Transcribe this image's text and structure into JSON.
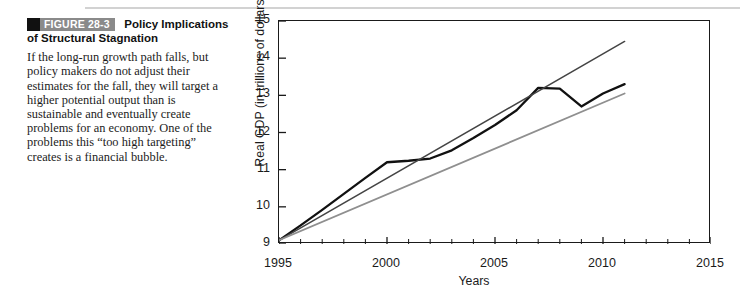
{
  "figure": {
    "badge_label": "FIGURE 28-3",
    "title_line1": "Policy Implications",
    "title_line2": "of Structural Stagnation",
    "body": "If the long-run growth path falls, but policy makers do not adjust their estimates for the fall, they will target a higher potential output than is sustainable and eventually create problems for an economy. One of the problems this “too high targeting” creates is a financial bubble."
  },
  "chart_data": {
    "type": "line",
    "title": "",
    "xlabel": "Years",
    "ylabel": "Real GDP (in trillions of dollars)",
    "xlim": [
      1995,
      2015
    ],
    "ylim": [
      9,
      15
    ],
    "xticks": [
      1995,
      2000,
      2005,
      2010,
      2015
    ],
    "xtick_labels": [
      "1995",
      "2000",
      "2005",
      "2010",
      "2015"
    ],
    "x_minor_tick_step": 1,
    "yticks": [
      9,
      10,
      11,
      12,
      13,
      14,
      15
    ],
    "ytick_labels": [
      "9",
      "10",
      "11",
      "12",
      "13",
      "14",
      "15"
    ],
    "grid": false,
    "legend_position": "inline-right",
    "series": [
      {
        "name": "Actual",
        "color": "#111111",
        "width": 2.3,
        "label": "Actual",
        "label_x": 2011.1,
        "label_y": 13.28,
        "x": [
          1995,
          1996,
          1997,
          1998,
          1999,
          2000,
          2001,
          2002,
          2003,
          2004,
          2005,
          2006,
          2007,
          2008,
          2009,
          2010,
          2011
        ],
        "y": [
          9.1,
          9.5,
          9.92,
          10.35,
          10.78,
          11.2,
          11.24,
          11.3,
          11.52,
          11.85,
          12.2,
          12.6,
          13.2,
          13.18,
          12.7,
          13.05,
          13.3
        ]
      },
      {
        "name": "3% trend",
        "color": "#444444",
        "width": 1.5,
        "label": "3% trend",
        "label_x": 2011.3,
        "label_y": 14.48,
        "x": [
          1995,
          2011
        ],
        "y": [
          9.1,
          14.45
        ]
      },
      {
        "name": "2.25% trend",
        "color": "#8f8f8f",
        "width": 1.8,
        "label": "2.25% trend",
        "label_x": 2011.3,
        "label_y": 13.0,
        "x": [
          1995,
          2011
        ],
        "y": [
          9.1,
          13.05
        ]
      }
    ]
  }
}
